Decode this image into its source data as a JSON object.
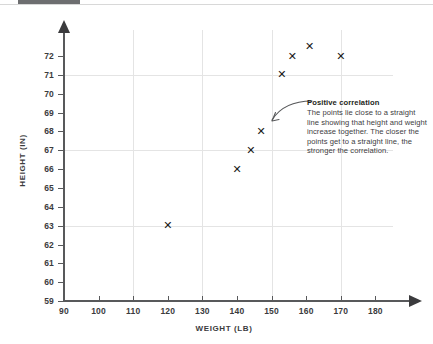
{
  "chart_data": {
    "type": "scatter",
    "title": "",
    "xlabel": "WEIGHT (LB)",
    "ylabel": "HEIGHT (IN)",
    "xlim": [
      90,
      185
    ],
    "ylim": [
      59,
      72.8
    ],
    "xticks": [
      90,
      100,
      110,
      120,
      130,
      140,
      150,
      160,
      170,
      180
    ],
    "yticks": [
      59,
      60,
      61,
      62,
      63,
      64,
      65,
      66,
      67,
      68,
      69,
      70,
      71,
      72
    ],
    "gridlines_x": [
      110,
      130,
      150,
      170
    ],
    "gridlines_y": [
      63,
      67,
      71
    ],
    "grid": true,
    "legend": false,
    "marker": "x",
    "marker_color": "#1a1a1a",
    "points": [
      {
        "x": 120,
        "y": 63
      },
      {
        "x": 140,
        "y": 66
      },
      {
        "x": 144,
        "y": 67
      },
      {
        "x": 147,
        "y": 68
      },
      {
        "x": 153,
        "y": 71
      },
      {
        "x": 156,
        "y": 72
      },
      {
        "x": 161,
        "y": 72.5
      },
      {
        "x": 170,
        "y": 72
      }
    ],
    "annotations": [
      {
        "title": "Positive correlation",
        "text": "The points lie close to a straight line showing that height and weight increase together. The closer the points get to a straight line, the stronger the correlation.",
        "points_to": {
          "x": 147,
          "y": 68
        }
      }
    ]
  },
  "axis": {
    "x_title": "WEIGHT (LB)",
    "y_title": "HEIGHT (IN)",
    "x_tick_labels": [
      "90",
      "100",
      "110",
      "120",
      "130",
      "140",
      "150",
      "160",
      "170",
      "180"
    ],
    "y_tick_labels": [
      "72",
      "71",
      "70",
      "69",
      "68",
      "67",
      "66",
      "65",
      "64",
      "63",
      "62",
      "61",
      "60",
      "59"
    ]
  },
  "annotation": {
    "title": "Positive correlation",
    "body": "The points lie close to a straight line showing that height and weight increase together. The closer the points get to a straight line, the stronger the correlation."
  },
  "colors": {
    "axis": "#58595b",
    "grid": "#e4e4e4",
    "marker": "#1a1a1a",
    "text": "#3b3b3d",
    "annotation_title": "#231f20",
    "annotation_body": "#414042"
  }
}
